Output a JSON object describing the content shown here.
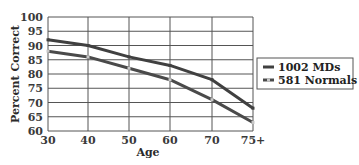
{
  "chart_data": {
    "type": "line",
    "title": "",
    "xlabel": "Age",
    "ylabel": "Percent Correct",
    "categories": [
      "30",
      "40",
      "50",
      "60",
      "70",
      "75+"
    ],
    "series": [
      {
        "name": "1002 MDs",
        "values": [
          92,
          90,
          86,
          83,
          78,
          68
        ],
        "color": "#404040",
        "marker_color": "#404040"
      },
      {
        "name": "581 Normals",
        "values": [
          88,
          86,
          82,
          78,
          71,
          63
        ],
        "color": "#4a4a4a",
        "marker_color": "#c8c8c8"
      }
    ],
    "ylim": [
      60,
      100
    ],
    "yticks": [
      60,
      65,
      70,
      75,
      80,
      85,
      90,
      95,
      100
    ],
    "grid": true,
    "legend_position": "right"
  }
}
